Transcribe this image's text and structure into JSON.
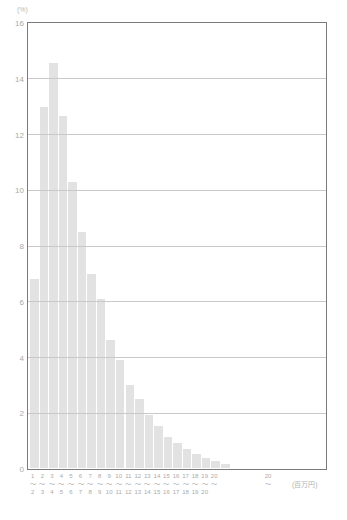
{
  "chart_data": {
    "type": "bar",
    "title": "",
    "subtitle": "",
    "xlabel": "(百万円)",
    "ylabel": "(%)",
    "ylim": [
      0,
      16
    ],
    "yticks": [
      0,
      2,
      4,
      6,
      8,
      10,
      12,
      14,
      16
    ],
    "ytick_labels": [
      "0",
      "2",
      "4",
      "6",
      "8",
      "10",
      "12",
      "14",
      "16"
    ],
    "grid": true,
    "legend": "none",
    "categories": [
      "0～1",
      "1～2",
      "2～3",
      "3～4",
      "4～5",
      "5～6",
      "6～7",
      "7～8",
      "8～9",
      "9～10",
      "10～11",
      "11～12",
      "12～13",
      "13～14",
      "14～15",
      "15～16",
      "16～17",
      "17～18",
      "18～19",
      "19～20",
      "20～"
    ],
    "values": [
      6.8,
      13.0,
      14.6,
      12.7,
      10.3,
      8.5,
      7.0,
      6.1,
      4.6,
      3.9,
      3.0,
      2.5,
      1.9,
      1.5,
      1.1,
      0.9,
      0.7,
      0.5,
      0.35,
      0.25,
      0.15
    ],
    "bar_color": "#e2e2e2",
    "gridline_color": "#c9c9c9",
    "frame_color": "#7a7a7a",
    "tick_text_color": "#aaaaaa",
    "x_tick_lower": [
      "1",
      "2",
      "3",
      "4",
      "5",
      "6",
      "7",
      "8",
      "9",
      "10",
      "11",
      "12",
      "13",
      "14",
      "15",
      "16",
      "17",
      "18",
      "19",
      "20"
    ],
    "x_tick_upper": [
      "2",
      "3",
      "4",
      "5",
      "6",
      "7",
      "8",
      "9",
      "10",
      "11",
      "12",
      "13",
      "14",
      "15",
      "16",
      "17",
      "18",
      "19",
      "20",
      ""
    ],
    "x_tick_separator": "～",
    "x_tail_label_value": "20",
    "x_tail_label_separator": "～"
  }
}
